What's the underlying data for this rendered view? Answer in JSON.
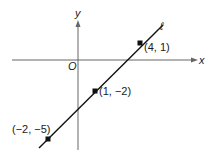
{
  "diagram": {
    "type": "coordinate-plane-line",
    "axes": {
      "x_label": "x",
      "y_label": "y",
      "origin_label": "O"
    },
    "line_label": "ℓ",
    "points": [
      {
        "label": "(4, 1)",
        "x": 4,
        "y": 1
      },
      {
        "label": "(1, −2)",
        "x": 1,
        "y": -2
      },
      {
        "label": "(−2, −5)",
        "x": -2,
        "y": -5
      }
    ],
    "colors": {
      "line": "#111111",
      "axis": "#555555",
      "point": "#111111"
    }
  }
}
